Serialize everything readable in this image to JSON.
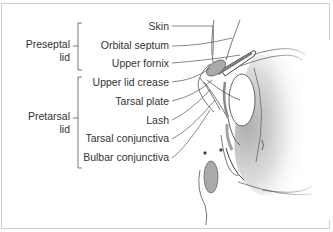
{
  "figure": {
    "groups": [
      {
        "id": "preseptal",
        "line1": "Preseptal",
        "line2": "lid"
      },
      {
        "id": "pretarsal",
        "line1": "Pretarsal",
        "line2": "lid"
      }
    ],
    "labels": [
      {
        "id": "skin",
        "text": "Skin"
      },
      {
        "id": "orbital-septum",
        "text": "Orbital septum"
      },
      {
        "id": "upper-fornix",
        "text": "Upper fornix"
      },
      {
        "id": "upper-lid-crease",
        "text": "Upper lid crease"
      },
      {
        "id": "tarsal-plate",
        "text": "Tarsal plate"
      },
      {
        "id": "lash",
        "text": "Lash"
      },
      {
        "id": "tarsal-conjunctiva",
        "text": "Tarsal conjunctiva"
      },
      {
        "id": "bulbar-conjunctiva",
        "text": "Bulbar conjunctiva"
      }
    ]
  }
}
